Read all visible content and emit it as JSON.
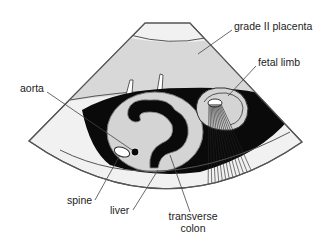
{
  "diagram": {
    "type": "ultrasound-sector-schematic",
    "colors": {
      "outline": "#555555",
      "sector_fill": "#f1f1f1",
      "placenta_fill": "#d8d8d8",
      "fluid_black": "#0a0a0a",
      "organ_fill": "#d4d4d4",
      "label_text": "#222222",
      "leader_line": "#444444"
    },
    "labels": {
      "placenta": "grade II placenta",
      "limb": "fetal limb",
      "aorta": "aorta",
      "spine": "spine",
      "liver": "liver",
      "colon_line1": "transverse",
      "colon_line2": "colon"
    }
  }
}
